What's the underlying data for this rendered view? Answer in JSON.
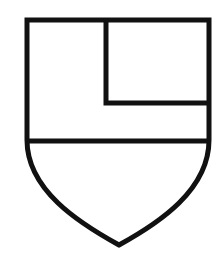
{
  "figure": {
    "type": "heraldic-shield",
    "colors": {
      "stroke": "#111111",
      "field": "#ffffff"
    },
    "stroke_width": 5,
    "shield": {
      "top_left": [
        27,
        20
      ],
      "top_right": [
        209,
        20
      ],
      "side_straight_to_y": 150,
      "point": [
        119,
        245
      ]
    },
    "fess_line": {
      "y": 141,
      "x1": 27,
      "x2": 209
    },
    "quarter": {
      "x": 106,
      "y_top": 20,
      "y_bottom": 103,
      "x_right": 209
    }
  }
}
